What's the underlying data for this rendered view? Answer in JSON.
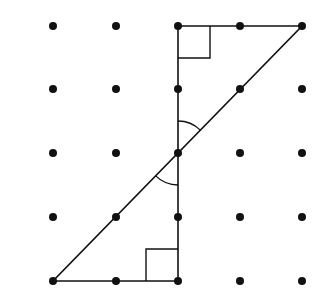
{
  "diagram": {
    "type": "dot-grid-geometry",
    "grid": {
      "rows": 5,
      "cols": 5,
      "xs": [
        53,
        116,
        178,
        240,
        302
      ],
      "ys": [
        26,
        89,
        153,
        217,
        281
      ]
    },
    "colors": {
      "ink": "#111111",
      "background": "#ffffff"
    },
    "triangles": [
      {
        "name": "upper-triangle",
        "vertices": [
          [
            2,
            0
          ],
          [
            4,
            0
          ],
          [
            2,
            2
          ]
        ],
        "right_angle_at": [
          2,
          0
        ]
      },
      {
        "name": "lower-triangle",
        "vertices": [
          [
            0,
            4
          ],
          [
            2,
            4
          ],
          [
            2,
            2
          ]
        ],
        "right_angle_at": [
          2,
          4
        ]
      }
    ],
    "marked_angles": [
      "vertical angles at center point (2,2)"
    ]
  }
}
